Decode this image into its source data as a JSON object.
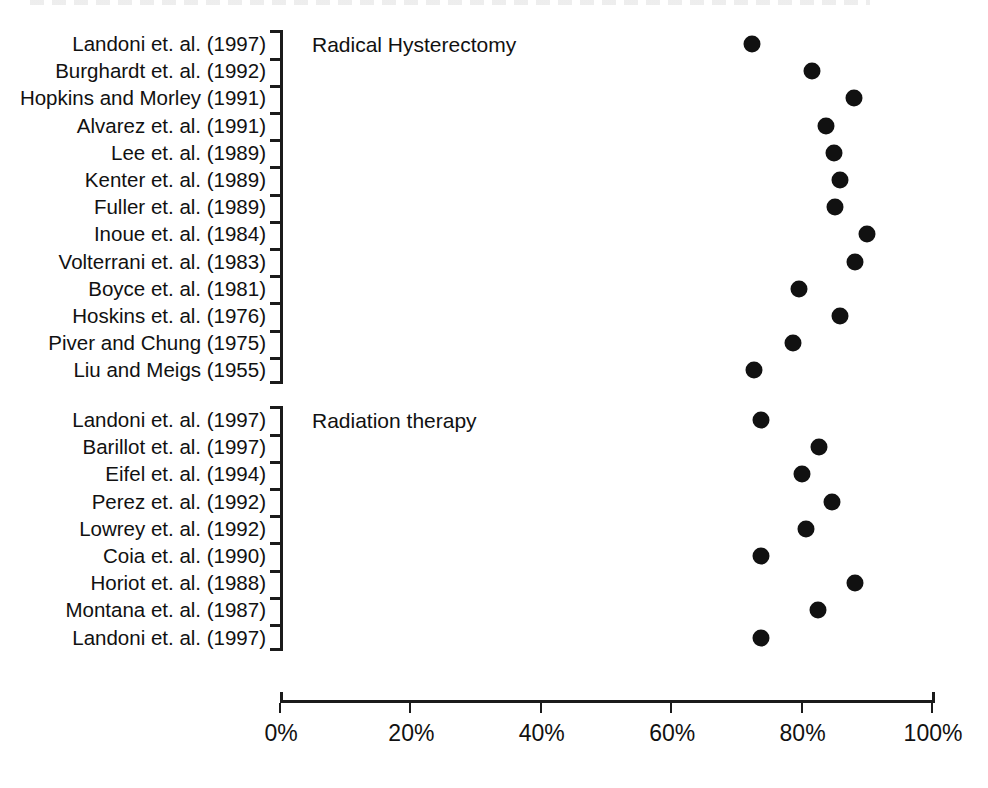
{
  "chart_data": {
    "type": "scatter",
    "title": "",
    "xlabel": "",
    "ylabel": "",
    "xlim": [
      0,
      100
    ],
    "xticks": [
      0,
      20,
      40,
      60,
      80,
      100
    ],
    "xtick_labels": [
      "0%",
      "20%",
      "40%",
      "60%",
      "80%",
      "100%"
    ],
    "grid": false,
    "legend": "none",
    "orientation": "horizontal-dot-plot",
    "marker": "filled-circle",
    "marker_color": "#111111",
    "groups": [
      {
        "name": "Radical Hysterectomy",
        "annotation": "Radical Hysterectomy",
        "categories": [
          "Landoni et. al. (1997)",
          "Burghardt et. al. (1992)",
          "Hopkins and Morley (1991)",
          "Alvarez et. al. (1991)",
          "Lee et. al. (1989)",
          "Kenter et. al. (1989)",
          "Fuller et. al. (1989)",
          "Inoue et. al. (1984)",
          "Volterrani et. al. (1983)",
          "Boyce et. al. (1981)",
          "Hoskins et. al. (1976)",
          "Piver and Chung (1975)",
          "Liu and Meigs (1955)"
        ],
        "values": [
          72.4,
          81.6,
          88.0,
          83.7,
          85.0,
          85.9,
          85.1,
          90.0,
          88.2,
          79.6,
          85.9,
          78.7,
          72.7
        ]
      },
      {
        "name": "Radiation therapy",
        "annotation": "Radiation therapy",
        "categories": [
          "Landoni et. al. (1997)",
          "Barillot et. al. (1997)",
          "Eifel et. al. (1994)",
          "Perez et. al. (1992)",
          "Lowrey et. al. (1992)",
          "Coia et. al. (1990)",
          "Horiot et. al. (1988)",
          "Montana et. al. (1987)",
          "Landoni et. al. (1997)"
        ],
        "values": [
          73.8,
          82.7,
          80.1,
          84.7,
          80.7,
          73.8,
          88.2,
          82.5,
          73.8
        ]
      }
    ]
  },
  "figure": {
    "background_color": "#ffffff",
    "foreground_color": "#111111"
  }
}
